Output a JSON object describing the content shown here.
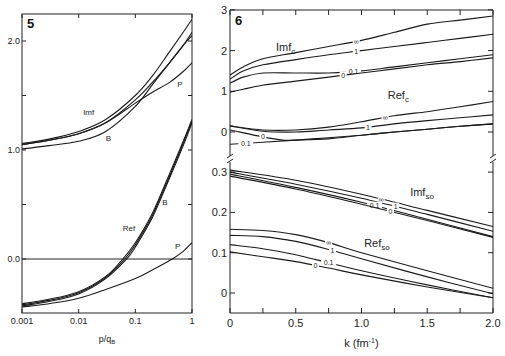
{
  "chart_data": [
    {
      "panel": "5",
      "type": "line",
      "xscale": "log",
      "xlabel": "p/q_B",
      "ylabel": "",
      "xlim": [
        0.001,
        1
      ],
      "ylim": [
        -0.5,
        2.2
      ],
      "xticks": [
        {
          "v": 0.001,
          "label": "0.001"
        },
        {
          "v": 0.01,
          "label": "0.01"
        },
        {
          "v": 0.1,
          "label": "0.1"
        },
        {
          "v": 1,
          "label": "1"
        }
      ],
      "yticks": [
        {
          "v": 2.0,
          "label": "2.0"
        },
        {
          "v": 1.5,
          "label": ""
        },
        {
          "v": 1.0,
          "label": "1.0"
        },
        {
          "v": 0.5,
          "label": ""
        },
        {
          "v": 0.0,
          "label": "0.0"
        }
      ],
      "hline": 0.0,
      "annotations": [
        {
          "text": "Imf",
          "x": 0.012,
          "y": 1.32
        },
        {
          "text": "B",
          "x": 0.03,
          "y": 1.08
        },
        {
          "text": "P",
          "x": 0.55,
          "y": 1.58
        },
        {
          "text": "Ref",
          "x": 0.06,
          "y": 0.26
        },
        {
          "text": "B",
          "x": 0.3,
          "y": 0.5
        },
        {
          "text": "P",
          "x": 0.5,
          "y": 0.09
        }
      ],
      "series": [
        {
          "name": "Imf upper",
          "x": [
            0.001,
            0.003,
            0.01,
            0.03,
            0.1,
            0.2,
            0.4,
            0.7,
            1
          ],
          "y": [
            1.06,
            1.1,
            1.17,
            1.28,
            1.5,
            1.68,
            1.9,
            2.08,
            2.2
          ]
        },
        {
          "name": "Imf mid",
          "x": [
            0.001,
            0.003,
            0.01,
            0.03,
            0.1,
            0.2,
            0.4,
            0.7,
            1
          ],
          "y": [
            1.05,
            1.09,
            1.15,
            1.25,
            1.46,
            1.62,
            1.8,
            1.96,
            2.08
          ]
        },
        {
          "name": "Imf B",
          "x": [
            0.001,
            0.003,
            0.01,
            0.03,
            0.1,
            0.2,
            0.4,
            0.7,
            1
          ],
          "y": [
            1.01,
            1.04,
            1.08,
            1.17,
            1.4,
            1.6,
            1.8,
            1.96,
            2.05
          ]
        },
        {
          "name": "Imf P",
          "x": [
            0.001,
            0.003,
            0.01,
            0.03,
            0.1,
            0.2,
            0.4,
            0.7,
            1
          ],
          "y": [
            1.05,
            1.09,
            1.15,
            1.25,
            1.43,
            1.53,
            1.62,
            1.72,
            1.8
          ]
        },
        {
          "name": "Ref 1",
          "x": [
            0.001,
            0.003,
            0.01,
            0.03,
            0.06,
            0.1,
            0.2,
            0.4,
            0.7,
            1
          ],
          "y": [
            -0.41,
            -0.37,
            -0.3,
            -0.16,
            0.0,
            0.15,
            0.42,
            0.78,
            1.08,
            1.28
          ]
        },
        {
          "name": "Ref 2",
          "x": [
            0.001,
            0.003,
            0.01,
            0.03,
            0.065,
            0.1,
            0.2,
            0.4,
            0.7,
            1
          ],
          "y": [
            -0.42,
            -0.38,
            -0.31,
            -0.17,
            0.0,
            0.13,
            0.4,
            0.76,
            1.06,
            1.27
          ]
        },
        {
          "name": "Ref B",
          "x": [
            0.001,
            0.003,
            0.01,
            0.03,
            0.07,
            0.1,
            0.2,
            0.4,
            0.7,
            1
          ],
          "y": [
            -0.43,
            -0.39,
            -0.32,
            -0.18,
            0.0,
            0.11,
            0.38,
            0.74,
            1.04,
            1.25
          ]
        },
        {
          "name": "Ref P",
          "x": [
            0.001,
            0.003,
            0.01,
            0.03,
            0.1,
            0.2,
            0.45,
            0.7,
            1
          ],
          "y": [
            -0.44,
            -0.41,
            -0.36,
            -0.28,
            -0.18,
            -0.1,
            0.0,
            0.07,
            0.15
          ]
        }
      ]
    },
    {
      "panel": "6",
      "type": "line",
      "xlabel": "k (fm⁻¹)",
      "xlim": [
        0,
        2.0
      ],
      "xticks": [
        {
          "v": 0,
          "label": "0"
        },
        {
          "v": 0.25,
          "label": ""
        },
        {
          "v": 0.5,
          "label": "0.5"
        },
        {
          "v": 0.75,
          "label": ""
        },
        {
          "v": 1.0,
          "label": "1.0"
        },
        {
          "v": 1.25,
          "label": ""
        },
        {
          "v": 1.5,
          "label": "1.5"
        },
        {
          "v": 1.75,
          "label": ""
        },
        {
          "v": 2.0,
          "label": "2.0"
        }
      ],
      "upper": {
        "ylim": [
          -0.7,
          3
        ],
        "yticks": [
          {
            "v": 3,
            "label": "3"
          },
          {
            "v": 2,
            "label": "2"
          },
          {
            "v": 1,
            "label": "1"
          },
          {
            "v": 0,
            "label": "0"
          }
        ],
        "annotations": [
          {
            "text": "Imf",
            "sub": "c",
            "x": 0.35,
            "y": 2.0
          },
          {
            "text": "Ref",
            "sub": "c",
            "x": 1.2,
            "y": 0.8
          }
        ],
        "series": [
          {
            "name": "Imf_c ∞",
            "label": "∞",
            "label_at": 0.96,
            "k": [
              0,
              0.1,
              0.25,
              0.5,
              0.75,
              1.0,
              1.25,
              1.5,
              1.75,
              2.0
            ],
            "y": [
              1.4,
              1.6,
              1.8,
              1.95,
              2.1,
              2.25,
              2.45,
              2.65,
              2.75,
              2.85
            ]
          },
          {
            "name": "Imf_c 1",
            "label": "1",
            "label_at": 0.96,
            "k": [
              0,
              0.1,
              0.25,
              0.5,
              0.75,
              1.0,
              1.25,
              1.5,
              1.75,
              2.0
            ],
            "y": [
              1.3,
              1.5,
              1.65,
              1.78,
              1.9,
              2.0,
              2.1,
              2.2,
              2.3,
              2.4
            ]
          },
          {
            "name": "Imf_c 0.1",
            "label": "0.1",
            "label_at": 0.94,
            "k": [
              0,
              0.1,
              0.25,
              0.5,
              0.75,
              1.0,
              1.25,
              1.5,
              1.75,
              2.0
            ],
            "y": [
              1.2,
              1.35,
              1.45,
              1.45,
              1.45,
              1.5,
              1.6,
              1.7,
              1.8,
              1.9
            ]
          },
          {
            "name": "Imf_c 0",
            "label": "0",
            "label_at": 0.86,
            "k": [
              0,
              0.1,
              0.25,
              0.5,
              0.75,
              1.0,
              1.25,
              1.5,
              1.75,
              2.0
            ],
            "y": [
              0.98,
              1.05,
              1.15,
              1.25,
              1.35,
              1.45,
              1.55,
              1.65,
              1.73,
              1.82
            ]
          },
          {
            "name": "Ref_c ∞",
            "label": "∞",
            "label_at": 1.18,
            "k": [
              0,
              0.25,
              0.5,
              0.75,
              1.0,
              1.25,
              1.5,
              1.75,
              2.0
            ],
            "y": [
              0.15,
              0.05,
              0.05,
              0.12,
              0.25,
              0.4,
              0.5,
              0.62,
              0.75
            ]
          },
          {
            "name": "Ref_c 1",
            "label": "1",
            "label_at": 1.05,
            "k": [
              0,
              0.25,
              0.5,
              0.75,
              1.0,
              1.25,
              1.5,
              1.75,
              2.0
            ],
            "y": [
              0.15,
              0.02,
              0.0,
              0.05,
              0.1,
              0.2,
              0.28,
              0.35,
              0.42
            ]
          },
          {
            "name": "Ref_c 0",
            "label": "0",
            "label_at": 0.25,
            "k": [
              0,
              0.25,
              0.4,
              0.5,
              0.75,
              1.0,
              1.25,
              1.5,
              1.75,
              2.0
            ],
            "y": [
              0.05,
              -0.12,
              -0.2,
              -0.2,
              -0.17,
              -0.08,
              0.0,
              0.07,
              0.14,
              0.2
            ]
          },
          {
            "name": "Ref_c 0.1",
            "label": "0.1",
            "label_at": 0.12,
            "k": [
              0,
              0.25,
              0.5,
              0.75,
              1.0,
              1.25,
              1.5,
              1.75,
              2.0
            ],
            "y": [
              -0.3,
              -0.25,
              -0.2,
              -0.14,
              -0.08,
              0.0,
              0.07,
              0.14,
              0.2
            ]
          }
        ]
      },
      "lower": {
        "ylim": [
          -0.05,
          0.33
        ],
        "yticks": [
          {
            "v": 0.3,
            "label": "0.3"
          },
          {
            "v": 0.2,
            "label": "0.2"
          },
          {
            "v": 0.1,
            "label": "0.1"
          },
          {
            "v": 0,
            "label": "0"
          }
        ],
        "annotations": [
          {
            "text": "Imf",
            "sub": "so",
            "x": 1.37,
            "y": 0.24
          },
          {
            "text": "Ref",
            "sub": "so",
            "x": 1.02,
            "y": 0.115
          }
        ],
        "series": [
          {
            "name": "Imf_so ∞",
            "label": "∞",
            "label_at": 1.15,
            "k": [
              0,
              0.5,
              1.0,
              1.5,
              2.0
            ],
            "y": [
              0.305,
              0.28,
              0.245,
              0.205,
              0.165
            ]
          },
          {
            "name": "Imf_so 1",
            "label": "1",
            "label_at": 1.26,
            "k": [
              0,
              0.5,
              1.0,
              1.5,
              2.0
            ],
            "y": [
              0.3,
              0.27,
              0.235,
              0.195,
              0.153
            ]
          },
          {
            "name": "Imf_so 0.1",
            "label": "0.1",
            "label_at": 1.1,
            "k": [
              0,
              0.5,
              1.0,
              1.5,
              2.0
            ],
            "y": [
              0.295,
              0.262,
              0.225,
              0.183,
              0.14
            ]
          },
          {
            "name": "Imf_so 0",
            "label": "0",
            "label_at": 1.22,
            "k": [
              0,
              0.5,
              1.0,
              1.5,
              2.0
            ],
            "y": [
              0.29,
              0.258,
              0.22,
              0.18,
              0.138
            ]
          },
          {
            "name": "Ref_so ∞",
            "label": "∞",
            "label_at": 0.75,
            "k": [
              0,
              0.25,
              0.5,
              0.75,
              1.0,
              1.5,
              2.0
            ],
            "y": [
              0.158,
              0.155,
              0.145,
              0.125,
              0.1,
              0.055,
              0.012
            ]
          },
          {
            "name": "Ref_so 1",
            "label": "1",
            "label_at": 0.78,
            "k": [
              0,
              0.25,
              0.5,
              0.75,
              1.0,
              1.5,
              2.0
            ],
            "y": [
              0.143,
              0.14,
              0.128,
              0.108,
              0.085,
              0.04,
              -0.002
            ]
          },
          {
            "name": "Ref_so 0.1",
            "label": "0.1",
            "label_at": 0.75,
            "k": [
              0,
              0.25,
              0.5,
              0.75,
              1.0,
              1.5,
              2.0
            ],
            "y": [
              0.12,
              0.11,
              0.095,
              0.075,
              0.055,
              0.02,
              -0.012
            ]
          },
          {
            "name": "Ref_so 0",
            "label": "0",
            "label_at": 0.65,
            "k": [
              0,
              0.25,
              0.5,
              0.75,
              1.0,
              1.5,
              2.0
            ],
            "y": [
              0.102,
              0.09,
              0.078,
              0.062,
              0.045,
              0.015,
              -0.012
            ]
          }
        ]
      }
    }
  ]
}
